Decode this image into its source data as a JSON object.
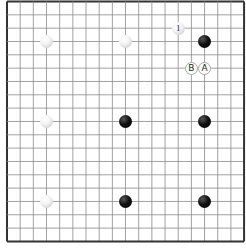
{
  "board": {
    "size": 19,
    "origin_x": 7,
    "origin_y": 1.5,
    "spacing_x": 13.17,
    "spacing_y": 13.33,
    "line_color": "#8a8a8a",
    "border_color": "#333333",
    "stone_diameter": 13
  },
  "stones": [
    {
      "color": "white",
      "col": 3,
      "row": 3,
      "label": ""
    },
    {
      "color": "white",
      "col": 9,
      "row": 3,
      "label": ""
    },
    {
      "color": "white",
      "col": 13,
      "row": 2,
      "label": "1"
    },
    {
      "color": "black",
      "col": 15,
      "row": 3,
      "label": ""
    },
    {
      "color": "white",
      "col": 3,
      "row": 9,
      "label": ""
    },
    {
      "color": "black",
      "col": 9,
      "row": 9,
      "label": ""
    },
    {
      "color": "black",
      "col": 15,
      "row": 9,
      "label": ""
    },
    {
      "color": "white",
      "col": 3,
      "row": 15,
      "label": ""
    },
    {
      "color": "black",
      "col": 9,
      "row": 15,
      "label": ""
    },
    {
      "color": "black",
      "col": 15,
      "row": 15,
      "label": ""
    }
  ],
  "labels": [
    {
      "text": "B",
      "col": 14,
      "row": 5
    },
    {
      "text": "A",
      "col": 15,
      "row": 5
    }
  ]
}
